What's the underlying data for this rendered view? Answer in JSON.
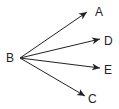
{
  "diagram": {
    "type": "arrow-fan",
    "nodes": {
      "origin": {
        "label": "B"
      },
      "targets": [
        {
          "label": "A"
        },
        {
          "label": "D"
        },
        {
          "label": "E"
        },
        {
          "label": "C"
        }
      ]
    },
    "edges": [
      {
        "from": "B",
        "to": "A",
        "arrowhead": "end"
      },
      {
        "from": "B",
        "to": "D",
        "arrowhead": "end"
      },
      {
        "from": "B",
        "to": "E",
        "arrowhead": "end"
      },
      {
        "from": "B",
        "to": "C",
        "arrowhead": "end"
      }
    ],
    "colors": {
      "line": "#222222",
      "text": "#222222",
      "background": "#ffffff"
    }
  }
}
